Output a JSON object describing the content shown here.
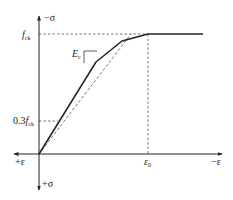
{
  "diagram": {
    "type": "stress-strain curve",
    "colors": {
      "stroke": "#222222",
      "dashed": "#555555",
      "background": "#ffffff"
    },
    "axes": {
      "y_top_label": "−σ",
      "y_bottom_label": "+σ",
      "x_left_label": "+ε",
      "x_right_label": "−ε"
    },
    "annotations": {
      "fck_main": "f",
      "fck_sub": "ck",
      "fck03_prefix": "0.3",
      "fck03_main": "f",
      "fck03_sub": "ck",
      "ec_main": "E",
      "ec_sub": "c",
      "eps0_main": "ε",
      "eps0_sub": "0"
    },
    "geometry": {
      "origin": [
        39,
        154
      ],
      "y_axis_top": 16,
      "y_axis_bottom": 190,
      "x_axis_left": 14,
      "x_axis_right": 222,
      "fck_level_y": 34,
      "fck03_level_y": 121,
      "eps0_x": 148,
      "plateau_end_x": 203,
      "curve_points": [
        [
          39,
          154
        ],
        [
          96,
          62
        ],
        [
          122,
          41
        ],
        [
          148,
          34
        ],
        [
          203,
          34
        ]
      ],
      "tangent_end": [
        131,
        34
      ]
    }
  }
}
